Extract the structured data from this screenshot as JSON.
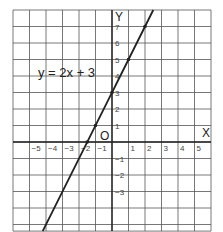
{
  "chart_data": {
    "type": "line",
    "title": "",
    "equation_label": "y = 2x + 3",
    "xlabel": "X",
    "ylabel": "Y",
    "origin_label": "O",
    "xlim": [
      -6,
      6
    ],
    "ylim": [
      -5.4,
      8
    ],
    "grid": true,
    "x_tick_labels": [
      "-5",
      "-4",
      "-3",
      "-2",
      "-1",
      "1",
      "2",
      "3",
      "4",
      "5"
    ],
    "x_ticks": [
      -5,
      -4,
      -3,
      -2,
      -1,
      1,
      2,
      3,
      4,
      5
    ],
    "y_tick_labels": [
      "7",
      "6",
      "5",
      "4",
      "3",
      "2",
      "1",
      "-1",
      "-2",
      "-3"
    ],
    "y_ticks": [
      7,
      6,
      5,
      4,
      3,
      2,
      1,
      -1,
      -2,
      -3
    ],
    "series": [
      {
        "name": "y = 2x + 3",
        "slope": 2,
        "intercept": 3,
        "x": [
          -4.2,
          2.5
        ],
        "y": [
          -5.4,
          8
        ]
      }
    ],
    "marked_points": [
      {
        "x": -1.5,
        "y": 0
      },
      {
        "x": -1,
        "y": 1
      },
      {
        "x": 0,
        "y": 3
      },
      {
        "x": 1,
        "y": 5
      },
      {
        "x": 2,
        "y": 7
      }
    ],
    "colors": {
      "grid": "#555555",
      "line": "#222222",
      "text": "#333333"
    }
  }
}
